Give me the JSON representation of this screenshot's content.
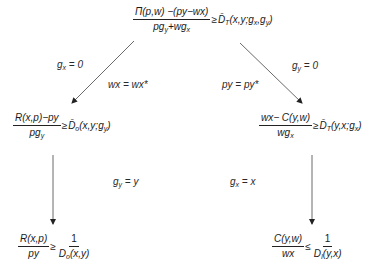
{
  "diagram": {
    "top": {
      "numerator": "Π(p,w) −(py−wx)",
      "denominator_parts": [
        "pg",
        "y",
        "+wg",
        "x"
      ],
      "relation": "≥",
      "rhs_func": "D̄",
      "rhs_sub": "T",
      "rhs_args": [
        "(x,y;g",
        "x",
        ",g",
        "y",
        ")"
      ]
    },
    "left_branch": {
      "condition_label_parts": [
        "g",
        "x",
        " = 0"
      ],
      "price_label": "wx = wx*",
      "formula": {
        "numerator": "R(x,p)−py",
        "denominator_parts": [
          "pg",
          "y"
        ],
        "relation": "≥",
        "rhs_func": "D̄",
        "rhs_sub": "o",
        "rhs_args": [
          "(x,y;g",
          "y",
          ")"
        ]
      },
      "second_condition_parts": [
        "g",
        "y",
        " = y"
      ],
      "result": {
        "numerator": "R(x,p)",
        "denominator": "py",
        "relation": "≥",
        "rhs_numerator": "1",
        "rhs_denominator_parts": [
          "D",
          "o",
          "(x,y)"
        ]
      }
    },
    "right_branch": {
      "condition_label_parts": [
        "g",
        "y",
        " = 0"
      ],
      "price_label": "py = py*",
      "formula": {
        "numerator": "wx− C(y,w)",
        "denominator_parts": [
          "wg",
          "x"
        ],
        "relation": "≥",
        "rhs_func": "D̄",
        "rhs_sub": "T",
        "rhs_args": [
          "(y,x;g",
          "x",
          ")"
        ]
      },
      "second_condition_parts": [
        "g",
        "x",
        " = x"
      ],
      "result": {
        "numerator": "C(y,w)",
        "denominator": "wx",
        "relation": "≤",
        "rhs_numerator": "1",
        "rhs_denominator_parts": [
          "D",
          "I",
          "(y,x)"
        ]
      }
    },
    "colors": {
      "line": "#333333",
      "text": "#1a1a1a"
    }
  }
}
